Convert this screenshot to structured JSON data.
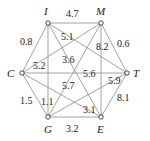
{
  "graph": {
    "nodes": [
      {
        "id": "I",
        "label": "I",
        "x": 48,
        "y": 23,
        "lx": 44,
        "ly": 15
      },
      {
        "id": "M",
        "label": "M",
        "x": 101,
        "y": 23,
        "lx": 96,
        "ly": 15
      },
      {
        "id": "C",
        "label": "C",
        "x": 22,
        "y": 73,
        "lx": 7,
        "ly": 77
      },
      {
        "id": "T",
        "label": "T",
        "x": 127,
        "y": 73,
        "lx": 133,
        "ly": 77
      },
      {
        "id": "G",
        "label": "G",
        "x": 48,
        "y": 117,
        "lx": 44,
        "ly": 133
      },
      {
        "id": "E",
        "label": "E",
        "x": 101,
        "y": 117,
        "lx": 97,
        "ly": 133
      }
    ],
    "edges": [
      {
        "from": "I",
        "to": "M",
        "weight": "4.7",
        "lx": 66,
        "ly": 17
      },
      {
        "from": "I",
        "to": "C",
        "weight": "0.8",
        "lx": 20,
        "ly": 45
      },
      {
        "from": "M",
        "to": "T",
        "weight": "0.6",
        "lx": 117,
        "ly": 47
      },
      {
        "from": "C",
        "to": "G",
        "weight": "1.5",
        "lx": 20,
        "ly": 104
      },
      {
        "from": "G",
        "to": "E",
        "weight": "3.2",
        "lx": 66,
        "ly": 132
      },
      {
        "from": "T",
        "to": "E",
        "weight": "8.1",
        "lx": 117,
        "ly": 101
      },
      {
        "from": "I",
        "to": "G",
        "weight": "1.1",
        "lx": 41,
        "ly": 105
      },
      {
        "from": "M",
        "to": "E",
        "weight": "8.2",
        "lx": 96,
        "ly": 50
      },
      {
        "from": "C",
        "to": "T",
        "weight": "5.6",
        "lx": 83,
        "ly": 77
      },
      {
        "from": "C",
        "to": "M",
        "weight": "5.2",
        "lx": 33,
        "ly": 69
      },
      {
        "from": "I",
        "to": "T",
        "weight": "5.1",
        "lx": 61,
        "ly": 40
      },
      {
        "from": "I",
        "to": "E",
        "weight": "3.6",
        "lx": 62,
        "ly": 63
      },
      {
        "from": "G",
        "to": "M",
        "weight": "5.7",
        "lx": 62,
        "ly": 89
      },
      {
        "from": "G",
        "to": "T",
        "weight": "5.9",
        "lx": 108,
        "ly": 84
      },
      {
        "from": "C",
        "to": "E",
        "weight": "3.1",
        "lx": 83,
        "ly": 113
      }
    ]
  }
}
